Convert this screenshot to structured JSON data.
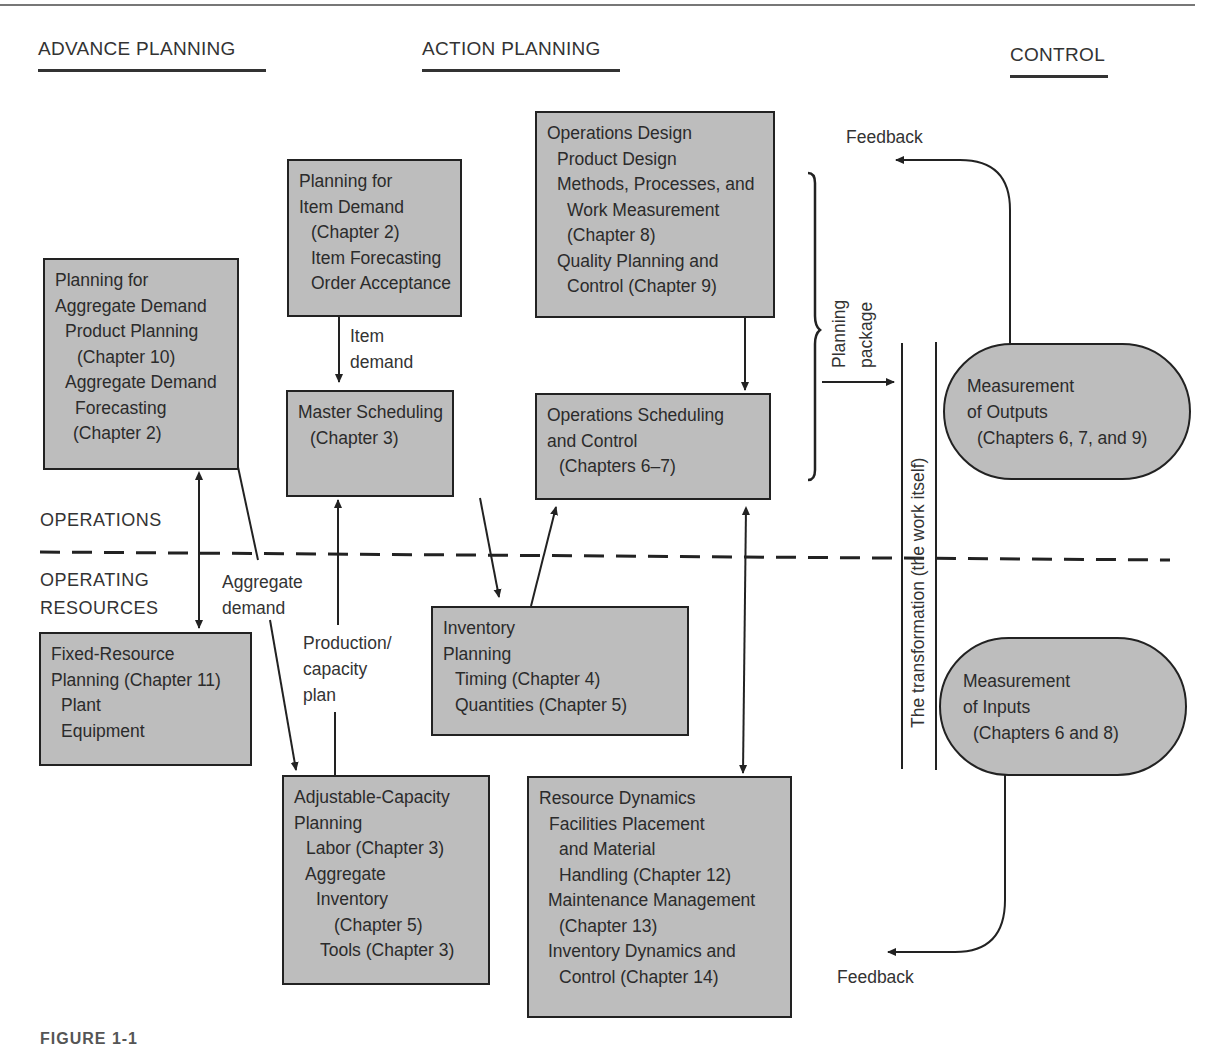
{
  "figure": {
    "caption": "FIGURE 1-1"
  },
  "columns": {
    "advance_planning": "ADVANCE PLANNING",
    "action_planning": "ACTION PLANNING",
    "control": "CONTROL"
  },
  "zones": {
    "operations": "OPERATIONS",
    "operating_resources": [
      "OPERATING",
      "RESOURCES"
    ]
  },
  "boxes": {
    "aggregate_demand": [
      "Planning for",
      "Aggregate Demand",
      "  Product Planning",
      "   (Chapter 10)",
      "  Aggregate Demand",
      "   Forecasting",
      "   (Chapter 2)"
    ],
    "item_demand": [
      "Planning for",
      "Item Demand",
      "  (Chapter 2)",
      "  Item Forecasting",
      "  Order Acceptance"
    ],
    "operations_design": [
      "Operations Design",
      "  Product Design",
      "  Methods, Processes, and",
      "   Work Measurement",
      "   (Chapter 8)",
      "  Quality Planning and",
      "   Control (Chapter 9)"
    ],
    "master_scheduling": [
      "Master Scheduling",
      "  (Chapter 3)"
    ],
    "operations_scheduling": [
      "Operations Scheduling",
      "and Control",
      "  (Chapters 6–7)"
    ],
    "fixed_resource": [
      "Fixed-Resource",
      "Planning (Chapter 11)",
      "  Plant",
      "  Equipment"
    ],
    "inventory_planning": [
      "Inventory",
      "Planning",
      "  Timing (Chapter 4)",
      "  Quantities (Chapter 5)"
    ],
    "adjustable_capacity": [
      "Adjustable-Capacity",
      "Planning",
      "  Labor (Chapter 3)",
      "  Aggregate",
      "    Inventory",
      "       (Chapter 5)",
      "    Tools (Chapter 3)"
    ],
    "resource_dynamics": [
      "Resource Dynamics",
      "  Facilities Placement",
      "    and Material",
      "    Handling (Chapter 12)",
      "  Maintenance Management",
      "    (Chapter 13)",
      "  Inventory Dynamics and",
      "    Control (Chapter 14)"
    ]
  },
  "pills": {
    "outputs": [
      "Measurement",
      "of Outputs",
      "  (Chapters 6, 7, and 9)"
    ],
    "inputs": [
      "Measurement",
      "of Inputs",
      "  (Chapters 6 and 8)"
    ]
  },
  "labels": {
    "item_demand": [
      "Item",
      "demand"
    ],
    "aggregate_demand": [
      "Aggregate",
      "demand"
    ],
    "production_capacity": [
      "Production/",
      "capacity",
      "plan"
    ],
    "planning_package": [
      "Planning",
      "package"
    ],
    "transformation": "The transformation (the work itself)",
    "feedback_top": "Feedback",
    "feedback_bottom": "Feedback"
  },
  "colors": {
    "box_fill": "#bdbdbd",
    "stroke": "#222222",
    "text": "#2b2b2b"
  }
}
